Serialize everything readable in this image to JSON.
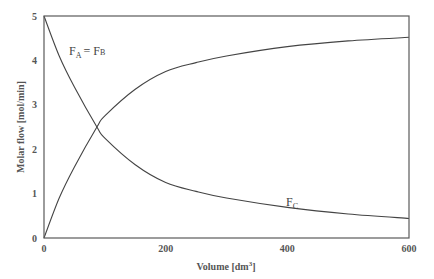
{
  "chart_data": {
    "type": "line",
    "title": "",
    "xlabel": "Volume [dm³]",
    "xlabel_parts": {
      "base": "Volume [dm",
      "sup": "3",
      "end": "]"
    },
    "ylabel": "Molar flow [mol/min]",
    "xlim": [
      0,
      600
    ],
    "ylim": [
      0,
      5
    ],
    "grid": false,
    "legend": "none (inline annotations)",
    "x_ticks": [
      0,
      200,
      400,
      600
    ],
    "y_ticks": [
      0,
      1,
      2,
      3,
      4,
      5
    ],
    "x": [
      0,
      25,
      50,
      87,
      100,
      150,
      200,
      250,
      300,
      400,
      500,
      600
    ],
    "series": [
      {
        "name": "F_A = F_B",
        "values": [
          5.0,
          4.1,
          3.4,
          2.5,
          2.25,
          1.65,
          1.25,
          1.05,
          0.9,
          0.69,
          0.54,
          0.44
        ]
      },
      {
        "name": "F_C",
        "values": [
          0.0,
          0.9,
          1.6,
          2.5,
          2.75,
          3.35,
          3.75,
          3.95,
          4.1,
          4.31,
          4.44,
          4.52
        ]
      }
    ],
    "annotations": [
      {
        "text": "F_A = F_B",
        "x": 42,
        "y": 4.3
      },
      {
        "text": "F_C",
        "x": 400,
        "y": 0.75
      }
    ]
  },
  "labels": {
    "fa_fb": {
      "f1": "F",
      "s1": "A",
      "eq": "= ",
      "f2": "F",
      "s2": "B"
    },
    "fc": {
      "f": "F",
      "s": "C"
    }
  }
}
